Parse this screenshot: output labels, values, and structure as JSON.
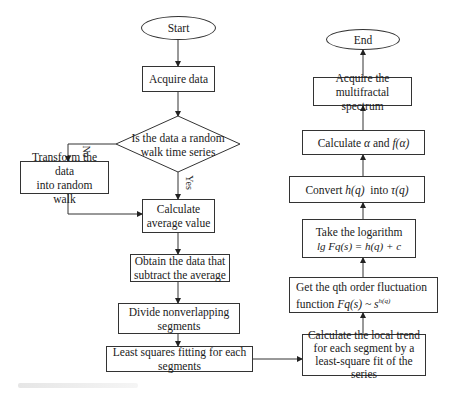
{
  "flowchart": {
    "start": "Start",
    "acquire_data": "Acquire data",
    "decision": {
      "line1": "Is the data a random",
      "line2": "walk time series",
      "no_label": "No",
      "yes_label": "Yes"
    },
    "transform": {
      "line1": "Transform the data",
      "line2": "into random walk"
    },
    "calc_average": {
      "line1": "Calculate",
      "line2": "average value"
    },
    "obtain": {
      "line1": "Obtain the data that",
      "line2": "subtract the average"
    },
    "divide": {
      "line1": "Divide nonverlapping",
      "line2": "segments"
    },
    "least_squares": {
      "line1": "Least squares fitting for each",
      "line2": "segments"
    },
    "local_trend": {
      "line1": "Calculate the local trend",
      "line2": "for each segment by a",
      "line3": "least-square fit of the series"
    },
    "fluctuation": {
      "line1": "Get the qth order fluctuation",
      "line2_prefix": "function ",
      "line2_math": "Fq(s) ~ s",
      "line2_sup": "h(q)"
    },
    "logarithm": {
      "line1": "Take the logarithm",
      "line2": "lg Fq(s) = h(q) + c"
    },
    "convert": {
      "prefix": "Convert ",
      "hq": "h(q)",
      "mid": "  into ",
      "tq": "τ(q)"
    },
    "calc_alpha": {
      "prefix": "Calculate ",
      "alpha": "α",
      "mid": " and ",
      "falpha": "f(α)"
    },
    "spectrum": {
      "line1": "Acquire the",
      "line2": "multifractal spectrum"
    },
    "end": "End"
  }
}
